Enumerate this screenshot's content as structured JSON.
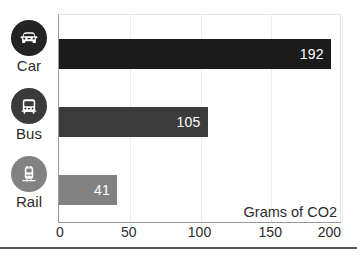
{
  "chart_data": {
    "type": "bar",
    "orientation": "horizontal",
    "title": "",
    "xlabel": "Grams of CO2",
    "ylabel": "",
    "categories": [
      "Car",
      "Bus",
      "Rail"
    ],
    "values": [
      192,
      105,
      41
    ],
    "value_labels": [
      "192",
      "105",
      "41"
    ],
    "series": [
      {
        "name": "Grams of CO2",
        "values": [
          192,
          105,
          41
        ]
      }
    ],
    "xlim": [
      0,
      200
    ],
    "xticks": [
      0,
      50,
      100,
      150,
      200
    ],
    "xtick_labels": [
      "0",
      "50",
      "100",
      "150",
      "200"
    ],
    "grid": true,
    "grid_axis": "x",
    "legend": false,
    "bar_colors": [
      "#1b1b1b",
      "#3b3b3b",
      "#828282"
    ],
    "value_label_color": "#ffffff",
    "icons": [
      {
        "name": "car-icon",
        "category": "Car",
        "circle_color": "#242424"
      },
      {
        "name": "bus-icon",
        "category": "Bus",
        "circle_color": "#3b3b3b"
      },
      {
        "name": "train-icon",
        "category": "Rail",
        "circle_color": "#828282"
      }
    ]
  },
  "colors": {
    "axis": "#9a9a9a",
    "grid": "#ededed",
    "text": "#2b2b2b",
    "footer_rule": "#58585a",
    "background": "#ffffff"
  }
}
